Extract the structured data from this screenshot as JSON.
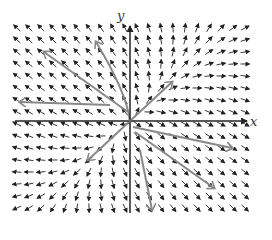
{
  "diagram": {
    "type": "phase-portrait-vector-field",
    "axes": {
      "x_label": "x",
      "y_label": "y"
    },
    "colors": {
      "field_arrows": "#222222",
      "trajectories": "#888888",
      "axes": "#222222",
      "background": "#ffffff"
    },
    "grid": {
      "x_min_px": 17,
      "x_max_px": 245,
      "y_min_px": 28,
      "y_max_px": 210,
      "spacing_px": 12
    },
    "origin_px": [
      130,
      121
    ],
    "matrix": [
      [
        2,
        -1
      ],
      [
        -1,
        2
      ]
    ],
    "trajectories": [
      {
        "name": "eigen-line-ur",
        "points": [
          [
            130,
            121
          ],
          [
            172,
            82
          ]
        ],
        "arrow_at": 0.85
      },
      {
        "name": "eigen-line-ll",
        "points": [
          [
            130,
            121
          ],
          [
            88,
            160
          ]
        ],
        "arrow_at": 0.8
      },
      {
        "name": "eigen-line-ul",
        "points": [
          [
            130,
            121
          ],
          [
            96,
            42
          ]
        ],
        "arrow_at": 1.0,
        "curve": true
      },
      {
        "name": "fast-ul",
        "points": [
          [
            128,
            112
          ],
          [
            44,
            52
          ]
        ],
        "arrow_at": 1.0
      },
      {
        "name": "fast-ul-2",
        "points": [
          [
            110,
            105
          ],
          [
            20,
            102
          ]
        ],
        "arrow_at": 1.0
      },
      {
        "name": "fast-lr",
        "points": [
          [
            133,
            127
          ],
          [
            232,
            148
          ]
        ],
        "arrow_at": 1.0
      },
      {
        "name": "fast-lr-2",
        "points": [
          [
            135,
            132
          ],
          [
            214,
            188
          ]
        ],
        "arrow_at": 1.0
      },
      {
        "name": "fast-lr-3",
        "points": [
          [
            140,
            150
          ],
          [
            152,
            210
          ]
        ],
        "arrow_at": 1.0
      }
    ]
  }
}
